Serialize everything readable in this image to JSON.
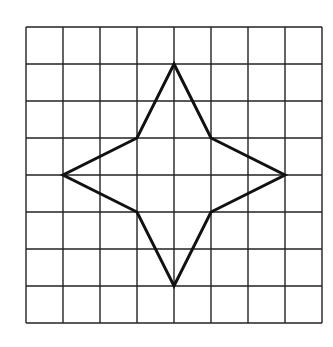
{
  "figure": {
    "grid": {
      "columns": 8,
      "rows": 8,
      "origin_px": [
        26,
        27
      ],
      "cell_px": 37,
      "line_color": "#222222"
    },
    "star": {
      "stroke_color": "#111111",
      "vertices_grid": [
        [
          4,
          1
        ],
        [
          5,
          3
        ],
        [
          7,
          4
        ],
        [
          5,
          5
        ],
        [
          4,
          7
        ],
        [
          3,
          5
        ],
        [
          1,
          4
        ],
        [
          3,
          3
        ]
      ]
    }
  }
}
